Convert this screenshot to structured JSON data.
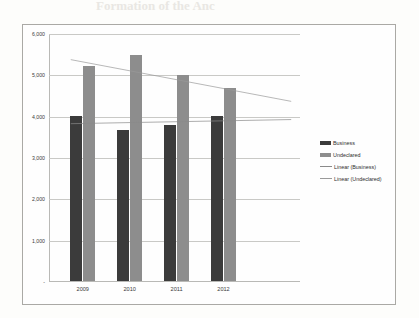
{
  "page": {
    "bleed_text_top": "Formation of the Anc",
    "bleed_text_mid": "Formation the An"
  },
  "chart_data": {
    "type": "bar",
    "title": "",
    "subtitle": "",
    "xlabel": "",
    "ylabel": "",
    "categories": [
      "2009",
      "2010",
      "2011",
      "2012"
    ],
    "ylim": [
      0,
      6000
    ],
    "ytick_labels": [
      "-",
      "1,000",
      "2,000",
      "3,000",
      "4,000",
      "5,000",
      "6,000"
    ],
    "ytick_values": [
      0,
      1000,
      2000,
      3000,
      4000,
      5000,
      6000
    ],
    "grid": true,
    "legend_position": "right",
    "series": [
      {
        "name": "Business",
        "type": "bar",
        "color": "#3b3b3b",
        "values": [
          4000,
          3650,
          3780,
          4000
        ]
      },
      {
        "name": "Undeclared",
        "type": "bar",
        "color": "#8d8d8d",
        "values": [
          5200,
          5480,
          4980,
          4680
        ]
      },
      {
        "name": "Linear (Business)",
        "type": "trendline",
        "color": "#8a8a8a",
        "endpoints": [
          3830,
          3930
        ]
      },
      {
        "name": "Linear (Undeclared)",
        "type": "trendline",
        "color": "#9a9a9a",
        "endpoints": [
          5380,
          4370
        ]
      }
    ],
    "legend": [
      "Business",
      "Undeclared",
      "Linear (Business)",
      "Linear (Undeclared)"
    ]
  }
}
